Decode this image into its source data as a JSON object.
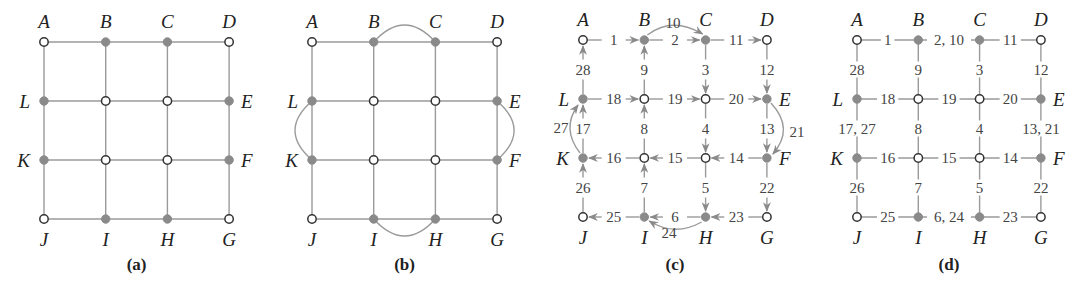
{
  "figure": {
    "colors": {
      "edge": "#9a9a9a",
      "odd_node_fill": "#8a8a8a",
      "even_node_fill": "#ffffff",
      "node_stroke": "#333333",
      "text": "#222222",
      "arrow": "#8a8a8a"
    },
    "node_names": [
      "A",
      "B",
      "C",
      "D",
      "E",
      "F",
      "G",
      "H",
      "I",
      "J",
      "K",
      "L"
    ],
    "odd_nodes": [
      "B",
      "C",
      "E",
      "F",
      "H",
      "I",
      "K",
      "L"
    ],
    "panels": [
      {
        "id": "a",
        "caption": "(a)",
        "origin": [
          44,
          42
        ],
        "step": [
          61.7,
          59
        ],
        "added_edges": []
      },
      {
        "id": "b",
        "caption": "(b)",
        "origin": [
          312,
          42
        ],
        "step": [
          61.7,
          59
        ],
        "added_edges": [
          [
            "B",
            "C"
          ],
          [
            "E",
            "F"
          ],
          [
            "H",
            "I"
          ],
          [
            "K",
            "L"
          ]
        ]
      },
      {
        "id": "c",
        "caption": "(c)",
        "origin": [
          583,
          40
        ],
        "step": [
          61.3,
          59
        ],
        "directed_edges": [
          {
            "from": "A",
            "to": "B",
            "label": "1"
          },
          {
            "from": "B",
            "to": "C",
            "label": "2"
          },
          {
            "from": "C",
            "to": "C3",
            "label": "3"
          },
          {
            "from": "C3",
            "to": "C4",
            "label": "4"
          },
          {
            "from": "C4",
            "to": "H",
            "label": "5"
          },
          {
            "from": "H",
            "to": "I",
            "label": "6"
          },
          {
            "from": "I",
            "to": "B4",
            "label": "7"
          },
          {
            "from": "B4",
            "to": "B3",
            "label": "8"
          },
          {
            "from": "B3",
            "to": "B",
            "label": "9"
          },
          {
            "from": "B",
            "to": "C",
            "label": "10",
            "curved": true
          },
          {
            "from": "C",
            "to": "D",
            "label": "11"
          },
          {
            "from": "D",
            "to": "E",
            "label": "12"
          },
          {
            "from": "E",
            "to": "F",
            "label": "13"
          },
          {
            "from": "F",
            "to": "C4",
            "label": "14"
          },
          {
            "from": "C4",
            "to": "B4",
            "label": "15"
          },
          {
            "from": "B4",
            "to": "K",
            "label": "16"
          },
          {
            "from": "K",
            "to": "L",
            "label": "17"
          },
          {
            "from": "L",
            "to": "B3",
            "label": "18"
          },
          {
            "from": "B3",
            "to": "C3",
            "label": "19"
          },
          {
            "from": "C3",
            "to": "E",
            "label": "20"
          },
          {
            "from": "E",
            "to": "F",
            "label": "21",
            "curved": true
          },
          {
            "from": "F",
            "to": "G",
            "label": "22"
          },
          {
            "from": "G",
            "to": "H",
            "label": "23"
          },
          {
            "from": "H",
            "to": "I",
            "label": "24",
            "curved": true
          },
          {
            "from": "I",
            "to": "J",
            "label": "25"
          },
          {
            "from": "J",
            "to": "K",
            "label": "26"
          },
          {
            "from": "K",
            "to": "L",
            "label": "27",
            "curved": true
          },
          {
            "from": "L",
            "to": "A",
            "label": "28"
          }
        ]
      },
      {
        "id": "d",
        "caption": "(d)",
        "origin": [
          857,
          40
        ],
        "step": [
          61.3,
          59
        ],
        "edge_labels": {
          "AB": "1",
          "BC": "2, 10",
          "CD": "11",
          "LB3": "18",
          "B3C3": "19",
          "C3E": "20",
          "KB4": "16",
          "B4C4": "15",
          "C4F": "14",
          "JI": "25",
          "IH": "6, 24",
          "HG": "23",
          "AL": "28",
          "LK": "17, 27",
          "KJ": "26",
          "BB3": "9",
          "B3B4": "8",
          "B4I": "7",
          "CC3": "3",
          "C3C4": "4",
          "C4H": "5",
          "DE": "12",
          "EF": "13, 21",
          "FG": "22"
        }
      }
    ]
  }
}
